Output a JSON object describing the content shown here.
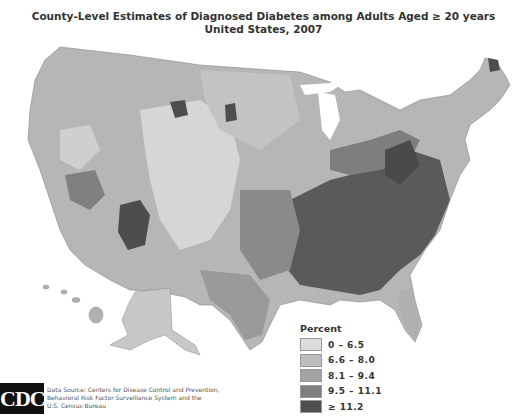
{
  "title": {
    "line1": "County-Level Estimates of Diagnosed Diabetes among Adults Aged ≥ 20 years",
    "line2": "United States, 2007"
  },
  "legend": {
    "title": "Percent",
    "items": [
      {
        "label": "0 – 6.5",
        "color": "#dcdcdc"
      },
      {
        "label": "6.6 – 8.0",
        "color": "#bdbdbd"
      },
      {
        "label": "8.1 – 9.4",
        "color": "#a3a3a3"
      },
      {
        "label": "9.5 – 11.1",
        "color": "#7f7f7f"
      },
      {
        "label": "≥ 11.2",
        "color": "#4f4f4f"
      }
    ]
  },
  "logo": {
    "text": "CDC"
  },
  "source": {
    "line1": "Data Source: Centers for Disease Control and Prevention,",
    "line2": "Behavioral Risk Factor Surveillance System and the",
    "line3": "U.S. Census Bureau"
  }
}
